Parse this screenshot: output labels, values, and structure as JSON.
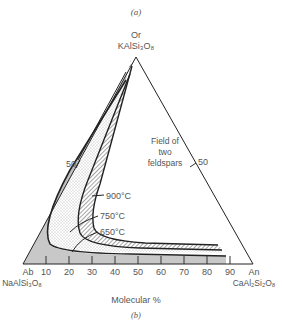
{
  "figure": {
    "caption_top": "(a)",
    "caption_bottom": "(b)",
    "apex_top": {
      "name": "Or",
      "formula": "KAlSi₃O₈"
    },
    "corner_left": {
      "name": "Ab",
      "formula": "NaAlSi₃O₈"
    },
    "corner_right": {
      "name": "An",
      "formula": "CaAl₂Si₂O₈"
    },
    "field_label": [
      "Field of",
      "two",
      "feldspars"
    ],
    "left_edge_tick": "50",
    "right_edge_tick": "50",
    "axis_title": "Molecular %",
    "base_ticks": [
      "10",
      "20",
      "30",
      "40",
      "50",
      "60",
      "70",
      "80",
      "90"
    ],
    "isotherms": [
      "900°C",
      "750°C",
      "650°C"
    ]
  },
  "colors": {
    "line": "#222222",
    "one_feldspar_fill": "#c8c8c8",
    "text": "#555555"
  }
}
